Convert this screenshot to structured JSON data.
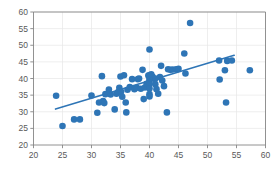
{
  "chart_data": {
    "type": "scatter",
    "title": "",
    "subtitle": "",
    "xlabel": "",
    "ylabel": "",
    "xlim": [
      20,
      60
    ],
    "ylim": [
      20,
      60
    ],
    "xticks": [
      20,
      25,
      30,
      35,
      40,
      45,
      50,
      55,
      60
    ],
    "xtick_labels": [
      "20",
      "25",
      "30",
      "35",
      "40",
      "45",
      "50",
      "55",
      "60"
    ],
    "yticks": [
      20,
      25,
      30,
      35,
      40,
      45,
      50,
      55,
      60
    ],
    "ytick_labels": [
      "20",
      "25",
      "30",
      "35",
      "40",
      "45",
      "50",
      "55",
      "60"
    ],
    "grid": true,
    "grid_color": "#e6e6e6",
    "legend": false,
    "legend_position": "none",
    "marker_color": "#2e75b6",
    "marker_size": 3.3,
    "series": [
      {
        "name": "observations",
        "marker": "circle",
        "points": [
          [
            23.9,
            34.8
          ],
          [
            25.0,
            25.7
          ],
          [
            27.0,
            27.7
          ],
          [
            28.0,
            27.7
          ],
          [
            30.0,
            34.9
          ],
          [
            31.0,
            29.7
          ],
          [
            31.3,
            32.8
          ],
          [
            31.8,
            40.7
          ],
          [
            32.0,
            33.2
          ],
          [
            32.2,
            32.6
          ],
          [
            32.4,
            35.3
          ],
          [
            33.0,
            36.7
          ],
          [
            33.3,
            35.2
          ],
          [
            34.0,
            30.7
          ],
          [
            34.3,
            35.4
          ],
          [
            34.6,
            35.9
          ],
          [
            34.8,
            37.2
          ],
          [
            35.0,
            40.6
          ],
          [
            35.1,
            36.0
          ],
          [
            35.3,
            34.5
          ],
          [
            35.6,
            41.0
          ],
          [
            35.9,
            32.8
          ],
          [
            36.0,
            29.8
          ],
          [
            36.2,
            36.6
          ],
          [
            36.6,
            37.4
          ],
          [
            37.0,
            39.8
          ],
          [
            37.4,
            36.8
          ],
          [
            37.8,
            37.2
          ],
          [
            38.0,
            39.8
          ],
          [
            38.2,
            40.0
          ],
          [
            38.5,
            36.9
          ],
          [
            38.8,
            42.6
          ],
          [
            39.0,
            33.8
          ],
          [
            39.2,
            37.3
          ],
          [
            39.5,
            38.4
          ],
          [
            39.8,
            40.9
          ],
          [
            40.0,
            48.7
          ],
          [
            40.0,
            41.0
          ],
          [
            40.0,
            40.2
          ],
          [
            40.0,
            39.5
          ],
          [
            40.0,
            38.4
          ],
          [
            40.0,
            37.0
          ],
          [
            40.0,
            35.3
          ],
          [
            40.0,
            34.6
          ],
          [
            40.3,
            41.3
          ],
          [
            40.5,
            40.6
          ],
          [
            40.8,
            39.9
          ],
          [
            41.0,
            40.0
          ],
          [
            41.0,
            38.3
          ],
          [
            41.2,
            36.8
          ],
          [
            41.5,
            35.4
          ],
          [
            41.8,
            40.4
          ],
          [
            42.0,
            43.8
          ],
          [
            42.2,
            39.4
          ],
          [
            42.5,
            37.7
          ],
          [
            43.0,
            29.8
          ],
          [
            43.2,
            42.8
          ],
          [
            43.6,
            42.6
          ],
          [
            44.0,
            42.7
          ],
          [
            44.6,
            42.8
          ],
          [
            45.0,
            42.9
          ],
          [
            46.0,
            47.5
          ],
          [
            46.2,
            41.5
          ],
          [
            47.0,
            56.7
          ],
          [
            52.0,
            45.4
          ],
          [
            52.1,
            39.7
          ],
          [
            53.0,
            42.5
          ],
          [
            53.2,
            32.8
          ],
          [
            53.4,
            45.3
          ],
          [
            54.2,
            45.4
          ],
          [
            57.3,
            42.5
          ]
        ]
      }
    ],
    "trendline": {
      "name": "linear-fit",
      "color": "#2e75b6",
      "x_start": 23.8,
      "y_start": 30.8,
      "x_end": 54.6,
      "y_end": 47.0
    }
  }
}
